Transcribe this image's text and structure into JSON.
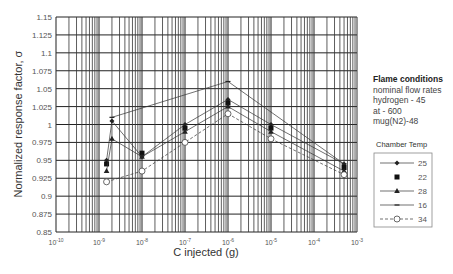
{
  "chart_data": {
    "type": "line",
    "title": "",
    "xlabel": "C injected (g)",
    "ylabel": "Normalized response factor, σ",
    "xscale": "log",
    "xlim": [
      1e-10,
      0.001
    ],
    "ylim": [
      0.85,
      1.15
    ],
    "grid": true,
    "x_tick_labels": [
      "10-10",
      "10-9",
      "10-8",
      "10-7",
      "10-6",
      "10-5",
      "10-4",
      "10-3"
    ],
    "x_tick_exponents": [
      -10,
      -9,
      -8,
      -7,
      -6,
      -5,
      -4,
      -3
    ],
    "y_ticks": [
      0.85,
      0.875,
      0.9,
      0.925,
      0.95,
      0.975,
      1,
      1.025,
      1.05,
      1.075,
      1.1,
      1.125,
      1.15
    ],
    "y_tick_labels": [
      "0.85",
      "0.875",
      "0.9",
      "0.925",
      "0.95",
      "0.975",
      "1",
      "1.025",
      "1.05",
      "1.075",
      "1.1",
      "1.125",
      "1.15"
    ],
    "legend_title": "Chamber Temp",
    "legend_position": "right",
    "series": [
      {
        "name": "25",
        "marker": "diamond",
        "line": "solid",
        "x": [
          1.5e-09,
          2e-09,
          1e-08,
          1e-07,
          1e-06,
          1e-05,
          0.0005
        ],
        "y": [
          0.95,
          1.005,
          0.955,
          1.0,
          1.035,
          1.0,
          0.945
        ]
      },
      {
        "name": "22",
        "marker": "square",
        "line": "none",
        "x": [
          1.5e-09,
          1e-08,
          1e-07,
          1e-06,
          1e-05,
          0.0005
        ],
        "y": [
          0.945,
          0.96,
          0.995,
          1.03,
          0.995,
          0.94
        ]
      },
      {
        "name": "28",
        "marker": "triangle",
        "line": "solid",
        "x": [
          1.5e-09,
          2e-09,
          1e-08,
          1e-07,
          1e-06,
          1e-05,
          0.0005
        ],
        "y": [
          0.935,
          0.98,
          0.955,
          0.99,
          1.025,
          0.99,
          0.935
        ]
      },
      {
        "name": "16",
        "marker": "dash",
        "line": "solid",
        "x": [
          2e-09,
          1e-06,
          0.0005
        ],
        "y": [
          1.01,
          1.06,
          0.945
        ]
      },
      {
        "name": "34",
        "marker": "open-circle",
        "line": "dashed",
        "x": [
          1.5e-09,
          1e-08,
          1e-07,
          1e-06,
          1e-05,
          0.0005
        ],
        "y": [
          0.92,
          0.935,
          0.975,
          1.015,
          0.98,
          0.93
        ]
      }
    ]
  },
  "annotation": {
    "heading": "Flame conditions",
    "lines": [
      "nominal flow rates",
      "hydrogen - 45",
      "at - 600",
      "mug(N2)-48"
    ]
  }
}
